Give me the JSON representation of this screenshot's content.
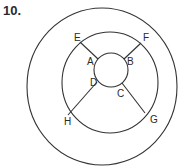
{
  "question_number": "10.",
  "diagram": {
    "circles": [
      {
        "name": "outer",
        "cx": 102,
        "cy": 86.5,
        "rx": 75,
        "ry": 78.5
      },
      {
        "name": "middle",
        "cx": 110,
        "cy": 82.5,
        "rx": 48,
        "ry": 50.5
      },
      {
        "name": "inner",
        "cx": 111,
        "cy": 70,
        "rx": 17,
        "ry": 17
      }
    ],
    "segments": [
      {
        "from": "E",
        "to": "A",
        "x1": 80,
        "y1": 42,
        "x2": 98,
        "y2": 59
      },
      {
        "from": "F",
        "to": "B",
        "x1": 141,
        "y1": 43,
        "x2": 124,
        "y2": 59
      },
      {
        "from": "H",
        "to": "D",
        "x1": 68,
        "y1": 115,
        "x2": 97,
        "y2": 82
      },
      {
        "from": "G",
        "to": "C",
        "x1": 145,
        "y1": 113,
        "x2": 122,
        "y2": 83
      }
    ],
    "labels": {
      "E": {
        "text": "E",
        "x": 74,
        "y": 41
      },
      "F": {
        "text": "F",
        "x": 143,
        "y": 41
      },
      "A": {
        "text": "A",
        "x": 87,
        "y": 65
      },
      "B": {
        "text": "B",
        "x": 127,
        "y": 65
      },
      "D": {
        "text": "D",
        "x": 90,
        "y": 86
      },
      "C": {
        "text": "C",
        "x": 117,
        "y": 97
      },
      "H": {
        "text": "H",
        "x": 64,
        "y": 125
      },
      "G": {
        "text": "G",
        "x": 150,
        "y": 123
      }
    },
    "stroke_color": "#333333"
  }
}
